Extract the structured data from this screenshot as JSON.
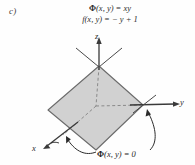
{
  "figure": {
    "part_label": "c)",
    "formulas": [
      {
        "lhs_symbol": "Φ",
        "text": "(x, y) = xy"
      },
      {
        "lhs_symbol": "f",
        "text": "(x, y) = − y + 1"
      }
    ],
    "formula_plain": [
      "Φ(x, y) = xy",
      "f(x, y) = − y + 1"
    ],
    "bottom_caption": {
      "symbol": "Φ",
      "text": "(x, y) = 0",
      "plain": "Φ(x, y) = 0"
    },
    "axes": {
      "z": "z",
      "y": "y",
      "x": "x"
    },
    "colors": {
      "surface_fill": "#cfcfcf",
      "surface_stroke": "#6b6b6b",
      "axis_stroke": "#3a3a3a",
      "dashed_stroke": "#8a8a8a",
      "annotation_stroke": "#2b2b2b",
      "text": "#2b2b2b",
      "background": "#fefefe"
    },
    "geometry": {
      "surface_type": "shaded-rhombus-plane",
      "vertices": [
        {
          "name": "top",
          "x": 99,
          "y": 66
        },
        {
          "name": "right",
          "x": 143,
          "y": 105
        },
        {
          "name": "bottom",
          "x": 96,
          "y": 150
        },
        {
          "name": "left",
          "x": 48,
          "y": 110
        }
      ],
      "origin": {
        "x": 96,
        "y": 106
      }
    }
  }
}
